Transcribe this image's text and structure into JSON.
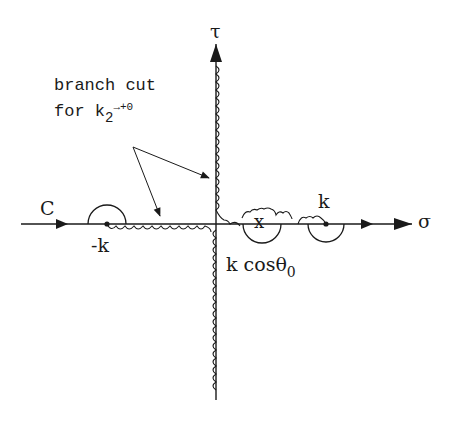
{
  "diagram": {
    "axes": {
      "horizontal_label": "σ",
      "vertical_label": "τ"
    },
    "contour_label": "C",
    "annotation": {
      "line1": "branch cut",
      "line2_prefix": "for  k",
      "line2_subscript": "2",
      "line2_suffix": "→+0"
    },
    "points": [
      {
        "id": "minus-k",
        "label": "-k",
        "marker": "dot",
        "indentation": "upper semicircle"
      },
      {
        "id": "pole",
        "label_prefix": "k cosθ",
        "label_subscript": "0",
        "marker": "x",
        "indentation": "circle below axis"
      },
      {
        "id": "plus-k",
        "label": "k",
        "marker": "dot",
        "indentation": "lower semicircle"
      }
    ],
    "colors": {
      "ink": "#1a1a1a",
      "background": "#ffffff"
    }
  }
}
